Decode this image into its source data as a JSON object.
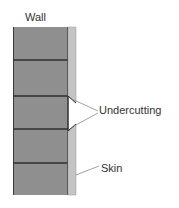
{
  "diagram": {
    "title": "Wall",
    "labels": {
      "wall": "Wall",
      "undercutting": "Undercutting",
      "skin": "Skin"
    },
    "colors": {
      "wall_fill": "#8f8f8f",
      "course_line": "#2f2f2f",
      "skin_fill": "#c4c4c4",
      "callout_line": "#7a7a7a",
      "text": "#333333"
    },
    "courses": 5
  }
}
